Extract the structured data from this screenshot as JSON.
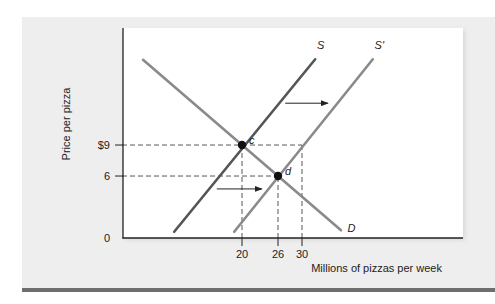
{
  "chart_data": {
    "type": "line",
    "title": "",
    "xlabel": "Millions of pizzas per week",
    "ylabel": "Price per pizza",
    "xlim": [
      0,
      57
    ],
    "ylim": [
      0,
      20
    ],
    "grid": false,
    "x_ticks": [
      {
        "value": 20,
        "label": "20"
      },
      {
        "value": 26,
        "label": "26"
      },
      {
        "value": 30,
        "label": "30"
      }
    ],
    "y_ticks": [
      {
        "value": 0,
        "label": "0"
      },
      {
        "value": 6,
        "label": "6"
      },
      {
        "value": 9,
        "label": "$9"
      }
    ],
    "series": [
      {
        "name": "D",
        "label": "D",
        "color": "#8a8a8a",
        "points": [
          [
            3.5,
            17.25
          ],
          [
            36.5,
            0.75
          ]
        ],
        "label_at": [
          37.6,
          0.6
        ]
      },
      {
        "name": "S",
        "label": "S",
        "color": "#555555",
        "points": [
          [
            8.7,
            0.6
          ],
          [
            32.2,
            17.3
          ]
        ],
        "label_at": [
          32.5,
          18.3
        ]
      },
      {
        "name": "S'",
        "label": "S'",
        "color": "#8a8a8a",
        "points": [
          [
            18.7,
            0.6
          ],
          [
            41.8,
            17.3
          ]
        ],
        "label_at": [
          42.1,
          18.3
        ]
      }
    ],
    "points": [
      {
        "name": "c",
        "label": "c",
        "x": 20,
        "y": 9
      },
      {
        "name": "d",
        "label": "d",
        "x": 26,
        "y": 6
      }
    ],
    "guides": [
      {
        "from": [
          0,
          9
        ],
        "to": [
          30,
          9
        ]
      },
      {
        "from": [
          0,
          6
        ],
        "to": [
          26,
          6
        ]
      },
      {
        "from": [
          20,
          0
        ],
        "to": [
          20,
          9
        ]
      },
      {
        "from": [
          26,
          0
        ],
        "to": [
          26,
          6
        ]
      },
      {
        "from": [
          30,
          0
        ],
        "to": [
          30,
          9
        ]
      }
    ],
    "arrows": [
      {
        "name": "shift-arrow-upper",
        "from": [
          27.2,
          13.05
        ],
        "to": [
          34.3,
          13.05
        ]
      },
      {
        "name": "shift-arrow-lower",
        "from": [
          15.8,
          4.75
        ],
        "to": [
          23.3,
          4.75
        ]
      }
    ]
  }
}
